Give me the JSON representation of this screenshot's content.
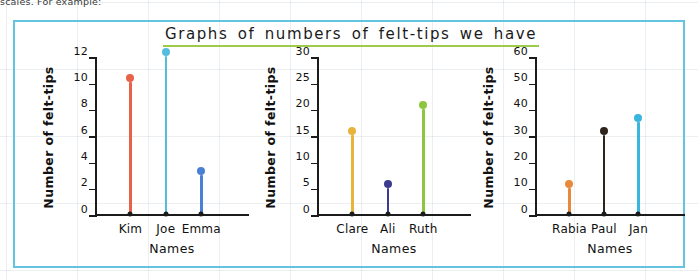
{
  "page": {
    "cut_text_above": "scales. For example:",
    "frame_border_color": "#63c3e0",
    "title": "Graphs of numbers of felt-tips we have",
    "title_underline_color": "#9ccc4a"
  },
  "chart_data": [
    {
      "type": "bar",
      "title": "",
      "categories": [
        "Kim",
        "Joe",
        "Emma"
      ],
      "values": [
        10,
        12,
        3
      ],
      "colors": [
        "#e8624a",
        "#55bcdd",
        "#4a7fd6"
      ],
      "xlabel": "Names",
      "ylabel": "Number of felt-tips",
      "ylim": [
        0,
        12
      ],
      "yticks": [
        0,
        2,
        4,
        6,
        8,
        10,
        12
      ],
      "grid": false,
      "legend": "none"
    },
    {
      "type": "bar",
      "title": "",
      "categories": [
        "Clare",
        "Ali",
        "Ruth"
      ],
      "values": [
        15,
        5,
        20
      ],
      "colors": [
        "#e8b33c",
        "#3b3b8f",
        "#8dc63f"
      ],
      "xlabel": "Names",
      "ylabel": "Number of felt-tips",
      "ylim": [
        0,
        30
      ],
      "yticks": [
        0,
        5,
        10,
        15,
        20,
        25,
        30
      ],
      "grid": false,
      "legend": "none"
    },
    {
      "type": "bar",
      "title": "",
      "categories": [
        "Rabia",
        "Paul",
        "Jan"
      ],
      "values": [
        10,
        30,
        35
      ],
      "colors": [
        "#e8893c",
        "#2f241c",
        "#3ab5dd"
      ],
      "xlabel": "Names",
      "ylabel": "Number of felt-tips",
      "ylim": [
        0,
        60
      ],
      "yticks": [
        0,
        10,
        20,
        30,
        40,
        50,
        60
      ],
      "grid": false,
      "legend": "none"
    }
  ]
}
